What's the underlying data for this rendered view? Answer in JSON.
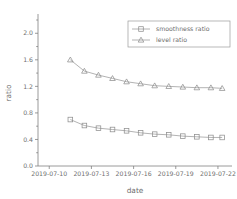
{
  "chart_data": {
    "type": "line",
    "title": "",
    "xlabel": "date",
    "ylabel": "ratio",
    "grid": false,
    "legend_position": "top-right",
    "ylim": [
      0.0,
      2.2
    ],
    "yticks": [
      "0.0",
      "0.4",
      "0.8",
      "1.2",
      "1.6",
      "2.0"
    ],
    "ytick_values": [
      0.0,
      0.4,
      0.8,
      1.2,
      1.6,
      2.0
    ],
    "xticks": [
      "2019-07-10",
      "2019-07-13",
      "2019-07-16",
      "2019-07-19",
      "2019-07-22"
    ],
    "xtick_values": [
      10,
      13,
      16,
      19,
      22
    ],
    "xlim": [
      9.2,
      23.0
    ],
    "x": [
      11.5,
      12.5,
      13.5,
      14.5,
      15.5,
      16.5,
      17.5,
      18.5,
      19.5,
      20.5,
      21.5,
      22.3
    ],
    "x_dates": [
      "2019-07-11",
      "2019-07-12",
      "2019-07-13",
      "2019-07-14",
      "2019-07-15",
      "2019-07-16",
      "2019-07-17",
      "2019-07-18",
      "2019-07-19",
      "2019-07-20",
      "2019-07-21",
      "2019-07-22"
    ],
    "series": [
      {
        "name": "smoothness ratio",
        "marker": "square",
        "color": "#8f8f8f",
        "values": [
          0.7,
          0.61,
          0.57,
          0.55,
          0.53,
          0.5,
          0.48,
          0.47,
          0.45,
          0.44,
          0.43,
          0.43
        ]
      },
      {
        "name": "level ratio",
        "marker": "triangle",
        "color": "#8f8f8f",
        "values": [
          1.6,
          1.43,
          1.37,
          1.32,
          1.27,
          1.24,
          1.21,
          1.2,
          1.19,
          1.18,
          1.18,
          1.17
        ]
      }
    ]
  },
  "legend": {
    "entries": [
      {
        "label": "smoothness ratio",
        "marker": "square-marker-icon"
      },
      {
        "label": "level ratio",
        "marker": "triangle-marker-icon"
      }
    ]
  },
  "axes": {
    "y_title": "ratio",
    "x_title": "date"
  }
}
